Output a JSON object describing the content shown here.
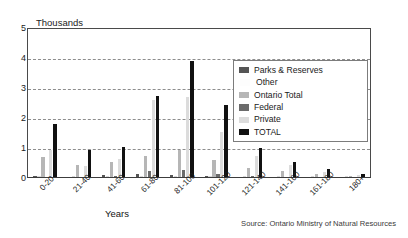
{
  "chart_data": {
    "type": "bar",
    "title": "",
    "ylabel": "Thousands",
    "xlabel": "Years",
    "ylim": [
      0,
      5
    ],
    "yticks": [
      0,
      1,
      2,
      3,
      4,
      5
    ],
    "grid": true,
    "legend_position": "right",
    "categories": [
      "0-20",
      "21-40",
      "41-60",
      "61-80",
      "81-100",
      "101-120",
      "121-140",
      "141-160",
      "161-180",
      "180+"
    ],
    "series": [
      {
        "name": "Parks & Reserves",
        "color": "#555555",
        "values": [
          0.08,
          0.05,
          0.1,
          0.12,
          0.1,
          0.07,
          0.04,
          0.03,
          0.02,
          0.01
        ]
      },
      {
        "name": "Other",
        "color": "#fdfdfd",
        "values": [
          0.05,
          0.04,
          0.06,
          0.08,
          0.07,
          0.05,
          0.03,
          0.02,
          0.01,
          0.01
        ]
      },
      {
        "name": "Ontario Total",
        "color": "#b6b6b6",
        "values": [
          0.7,
          0.45,
          0.55,
          0.75,
          0.95,
          0.6,
          0.35,
          0.25,
          0.12,
          0.06
        ]
      },
      {
        "name": "Federal",
        "color": "#6b6b6b",
        "values": [
          0.05,
          0.03,
          0.08,
          0.22,
          0.28,
          0.12,
          0.06,
          0.03,
          0.02,
          0.01
        ]
      },
      {
        "name": "Private",
        "color": "#dcdcdc",
        "values": [
          0.95,
          0.4,
          0.65,
          2.6,
          2.7,
          1.55,
          0.75,
          0.45,
          0.2,
          0.1
        ]
      },
      {
        "name": "TOTAL",
        "color": "#111111",
        "values": [
          1.8,
          0.95,
          1.05,
          2.75,
          3.9,
          2.45,
          1.0,
          0.55,
          0.3,
          0.15
        ]
      }
    ],
    "source": "Source: Ontario Ministry of Natural Resources"
  }
}
